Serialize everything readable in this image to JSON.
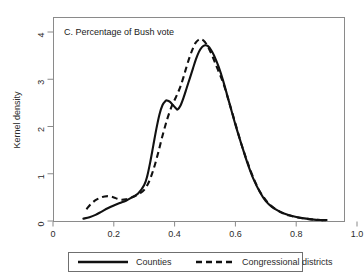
{
  "chart_data": {
    "type": "line",
    "title": "C. Percentage of Bush vote",
    "xlabel": "",
    "ylabel": "Kernel density",
    "xlim": [
      0,
      1.0
    ],
    "ylim": [
      0,
      4
    ],
    "grid": false,
    "legend_position": "bottom",
    "xticks": [
      "0",
      "0.2",
      "0.4",
      "0.6",
      "0.8",
      "1.0"
    ],
    "xtick_values": [
      0,
      0.2,
      0.4,
      0.6,
      0.8,
      1.0
    ],
    "yticks": [
      "0",
      "1",
      "2",
      "3",
      "4"
    ],
    "ytick_values": [
      0,
      1,
      2,
      3,
      4
    ],
    "series": [
      {
        "name": "Counties",
        "style": "solid",
        "color": "#111111",
        "x": [
          0.1,
          0.12,
          0.14,
          0.16,
          0.18,
          0.2,
          0.22,
          0.24,
          0.26,
          0.28,
          0.3,
          0.31,
          0.32,
          0.33,
          0.34,
          0.35,
          0.36,
          0.37,
          0.375,
          0.385,
          0.395,
          0.405,
          0.41,
          0.42,
          0.43,
          0.44,
          0.45,
          0.46,
          0.47,
          0.48,
          0.49,
          0.5,
          0.51,
          0.52,
          0.53,
          0.545,
          0.56,
          0.58,
          0.6,
          0.62,
          0.64,
          0.66,
          0.68,
          0.7,
          0.72,
          0.74,
          0.76,
          0.79,
          0.82,
          0.85,
          0.88,
          0.9
        ],
        "y": [
          0.05,
          0.08,
          0.13,
          0.2,
          0.27,
          0.33,
          0.38,
          0.43,
          0.5,
          0.58,
          0.76,
          0.95,
          1.25,
          1.6,
          1.95,
          2.25,
          2.45,
          2.54,
          2.55,
          2.52,
          2.45,
          2.38,
          2.36,
          2.45,
          2.62,
          2.82,
          3.02,
          3.22,
          3.42,
          3.58,
          3.68,
          3.72,
          3.7,
          3.62,
          3.5,
          3.26,
          2.96,
          2.5,
          2.04,
          1.62,
          1.22,
          0.88,
          0.62,
          0.42,
          0.3,
          0.22,
          0.16,
          0.1,
          0.06,
          0.035,
          0.02,
          0.02
        ]
      },
      {
        "name": "Congressional districts",
        "style": "dashed",
        "color": "#111111",
        "x": [
          0.11,
          0.125,
          0.14,
          0.155,
          0.17,
          0.185,
          0.2,
          0.212,
          0.225,
          0.24,
          0.255,
          0.27,
          0.285,
          0.3,
          0.315,
          0.33,
          0.345,
          0.36,
          0.375,
          0.39,
          0.4,
          0.41,
          0.42,
          0.43,
          0.44,
          0.45,
          0.46,
          0.47,
          0.48,
          0.485,
          0.495,
          0.505,
          0.515,
          0.525,
          0.54,
          0.56,
          0.58,
          0.6,
          0.62,
          0.64,
          0.66,
          0.68,
          0.7,
          0.72,
          0.745,
          0.775,
          0.81,
          0.85,
          0.88,
          0.9
        ],
        "y": [
          0.25,
          0.36,
          0.44,
          0.49,
          0.52,
          0.525,
          0.5,
          0.47,
          0.45,
          0.46,
          0.49,
          0.53,
          0.58,
          0.66,
          0.82,
          1.08,
          1.42,
          1.8,
          2.14,
          2.42,
          2.56,
          2.7,
          2.86,
          3.06,
          3.28,
          3.48,
          3.65,
          3.78,
          3.84,
          3.85,
          3.82,
          3.74,
          3.62,
          3.48,
          3.24,
          2.92,
          2.5,
          2.06,
          1.62,
          1.24,
          0.9,
          0.63,
          0.44,
          0.31,
          0.2,
          0.12,
          0.07,
          0.035,
          0.02,
          0.02
        ]
      }
    ]
  },
  "legend": {
    "items": [
      {
        "label": "Counties",
        "style": "solid"
      },
      {
        "label": "Congressional districts",
        "style": "dashed"
      }
    ]
  }
}
